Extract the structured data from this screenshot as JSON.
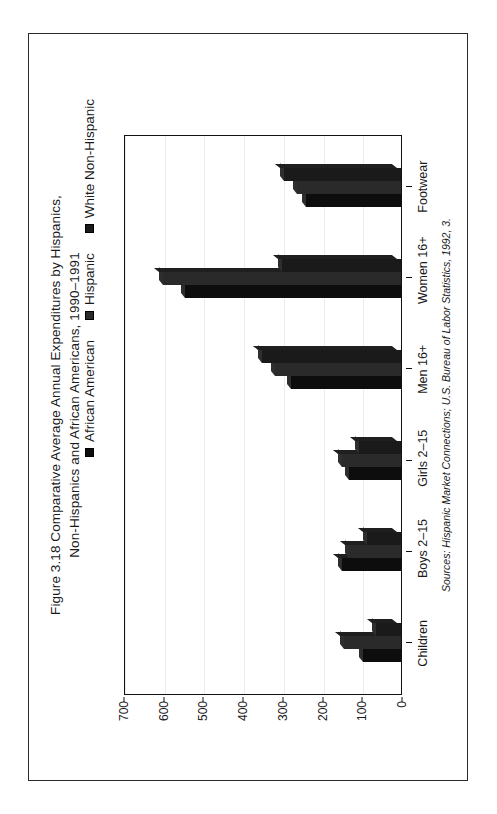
{
  "page": {
    "background": "#ffffff",
    "frame_color": "#2b2b2b"
  },
  "figure": {
    "title": "Figure 3.18  Comparative Average Annual Expenditures by Hispanics,\nNon-Hispanics and African Americans, 1990–1991",
    "source_note": "Sources: Hispanic Market Connections; U.S. Bureau of Labor Statistics, 1992, 3.",
    "orientation": "rotated-90-ccw"
  },
  "legend": {
    "position": "top",
    "items": [
      {
        "label": "African American",
        "color": "#0d0d0d",
        "swatch_name": "legend-swatch-african-american"
      },
      {
        "label": "Hispanic",
        "color": "#2a2a2a",
        "swatch_name": "legend-swatch-hispanic"
      },
      {
        "label": "White Non-Hispanic",
        "color": "#1a1a1a",
        "swatch_name": "legend-swatch-white-non-hispanic"
      }
    ]
  },
  "chart_data": {
    "type": "bar",
    "title": "Figure 3.18  Comparative Average Annual Expenditures by Hispanics, Non-Hispanics and African Americans, 1990–1991",
    "subtitle": "",
    "xlabel": "",
    "ylabel": "",
    "categories": [
      "Children",
      "Boys 2–15",
      "Girls 2–15",
      "Men  16+",
      "Women  16+",
      "Footwear"
    ],
    "series": [
      {
        "name": "African American",
        "color": "#0d0d0d",
        "values": [
          96,
          148,
          130,
          278,
          545,
          238
        ]
      },
      {
        "name": "Hispanic",
        "color": "#2a2a2a",
        "values": [
          143,
          130,
          148,
          318,
          600,
          262
        ]
      },
      {
        "name": "White Non-Hispanic",
        "color": "#1a1a1a",
        "values": [
          62,
          85,
          105,
          350,
          300,
          295
        ]
      }
    ],
    "ylim": [
      0,
      700
    ],
    "yticks": [
      0,
      100,
      200,
      300,
      400,
      500,
      600,
      700
    ],
    "ytick_labels": [
      "0",
      "100",
      "200",
      "300",
      "400",
      "500",
      "600",
      "700"
    ],
    "grid": true,
    "legend_position": "top",
    "style": "3d-columns",
    "units": "U.S. dollars (average annual expenditure)"
  }
}
